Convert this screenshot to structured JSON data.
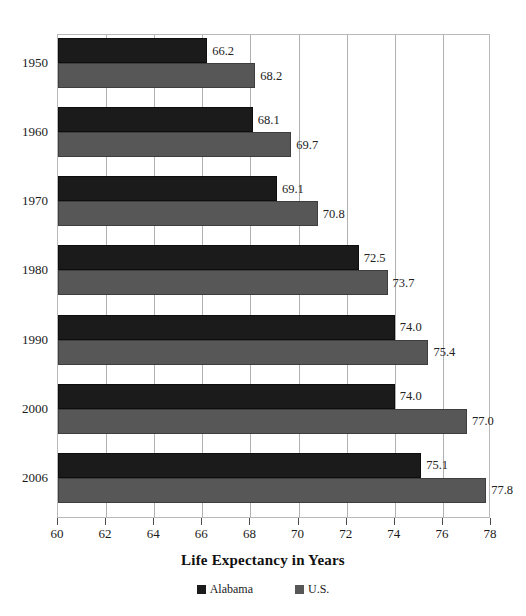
{
  "chart_data": {
    "type": "bar",
    "orientation": "horizontal",
    "title": "",
    "xlabel": "Life Expectancy in Years",
    "ylabel": "",
    "xlim": [
      60,
      78
    ],
    "xticks": [
      60,
      62,
      64,
      66,
      68,
      70,
      72,
      74,
      76,
      78
    ],
    "grid": true,
    "legend_position": "bottom",
    "categories": [
      "1950",
      "1960",
      "1970",
      "1980",
      "1990",
      "2000",
      "2006"
    ],
    "series": [
      {
        "name": "Alabama",
        "color": "#1b1b1b",
        "values": [
          66.2,
          68.1,
          69.1,
          72.5,
          74.0,
          74.0,
          75.1
        ]
      },
      {
        "name": "U.S.",
        "color": "#575757",
        "values": [
          68.2,
          69.7,
          70.8,
          73.7,
          75.4,
          77.0,
          77.8
        ]
      }
    ]
  },
  "axis": {
    "title": "Life Expectancy in Years",
    "tick_labels": [
      "60",
      "62",
      "64",
      "66",
      "68",
      "70",
      "72",
      "74",
      "76",
      "78"
    ]
  },
  "legend": {
    "items": [
      {
        "label": "Alabama",
        "color": "#1b1b1b",
        "swatch": "legend-swatch-dark"
      },
      {
        "label": "U.S.",
        "color": "#575757",
        "swatch": "legend-swatch-gray"
      }
    ]
  },
  "year_labels": [
    "1950",
    "1960",
    "1970",
    "1980",
    "1990",
    "2000",
    "2006"
  ],
  "bar_labels": [
    "66.2",
    "68.2",
    "68.1",
    "69.7",
    "69.1",
    "70.8",
    "72.5",
    "73.7",
    "74.0",
    "75.4",
    "74.0",
    "77.0",
    "75.1",
    "77.8"
  ]
}
